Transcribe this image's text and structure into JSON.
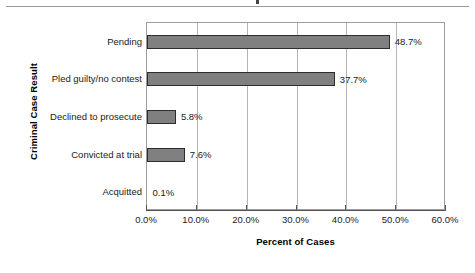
{
  "figure": {
    "has_top_rule": true,
    "background_color": "#ffffff"
  },
  "chart_data": {
    "type": "bar",
    "orientation": "horizontal",
    "title": "",
    "xlabel": "Percent of Cases",
    "ylabel": "Criminal Case Result",
    "categories": [
      "Pending",
      "Pled guilty/no contest",
      "Declined to prosecute",
      "Convicted at trial",
      "Acquitted"
    ],
    "values": [
      48.7,
      37.7,
      5.8,
      7.6,
      0.1
    ],
    "data_labels": [
      "48.7%",
      "37.7%",
      "5.8%",
      "7.6%",
      "0.1%"
    ],
    "xlim": [
      0,
      60
    ],
    "xticks": [
      0,
      10,
      20,
      30,
      40,
      50,
      60
    ],
    "xtick_labels": [
      "0.0%",
      "10.0%",
      "20.0%",
      "30.0%",
      "40.0%",
      "50.0%",
      "60.0%"
    ],
    "grid": "vertical",
    "legend": null,
    "bar_color": "#808080",
    "bar_edge_color": "#2d2d2d",
    "gridline_color": "#b4b4b4",
    "axis_color": "#555555"
  }
}
